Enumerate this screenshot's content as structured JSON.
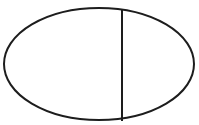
{
  "figure": {
    "title": "Ellipse divided by a vertical chord",
    "canvas": {
      "width": 199,
      "height": 125,
      "background_color": "#ffffff"
    },
    "style": {
      "stroke_color": "#1d1d1d",
      "stroke_width": 2,
      "fill": "none"
    },
    "shapes": [
      {
        "name": "ellipse-outline",
        "type": "ellipse",
        "center_x": 99,
        "center_y": 64,
        "radius_x": 95,
        "radius_y": 56,
        "stroke_color": "#1d1d1d",
        "stroke_width": 2,
        "fill": "none"
      },
      {
        "name": "vertical-chord",
        "type": "line",
        "x1": 122,
        "y1": 9,
        "x2": 122,
        "y2": 121,
        "stroke_color": "#1d1d1d",
        "stroke_width": 2
      }
    ],
    "labels": []
  }
}
